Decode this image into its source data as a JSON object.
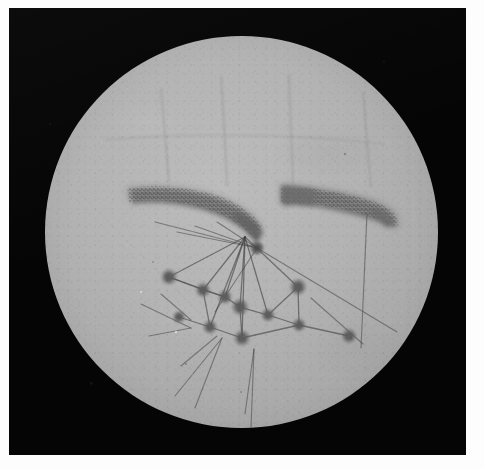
{
  "figure": {
    "name": "circular-field-photomicrograph",
    "caption": "",
    "label": ""
  },
  "plate": {
    "width": 484,
    "height": 469,
    "margin_color": "#fdfdfd",
    "field_color": "#050505",
    "field": {
      "x": 9,
      "y": 8,
      "width": 457,
      "height": 447
    }
  },
  "field_of_view": {
    "shape": "circle",
    "center_x": 241,
    "center_y": 232,
    "radius": 196,
    "fill_color": "#b3b3b3",
    "rim_color": "#8f9090"
  },
  "bands": [
    {
      "id": "band-left",
      "label": "left dark band",
      "color": "#7a7a7a",
      "start_x": 126,
      "start_y": 192,
      "end_x": 253,
      "end_y": 237,
      "thickness": 20,
      "note": "tapers from blunt left tip, curves downward to the hub"
    },
    {
      "id": "band-right",
      "label": "right dark band",
      "color": "#7c7c7c",
      "start_x": 272,
      "start_y": 188,
      "end_x": 385,
      "end_y": 219,
      "thickness": 19,
      "note": "roughly horizontal, slight downward slope to the right"
    }
  ],
  "faint_lines": {
    "label": "faint vertical striations in upper field",
    "color": "rgba(90,90,90,0.30)",
    "count": 4
  },
  "network": {
    "label": "node and filament network",
    "node_color": "#5d5d5d",
    "line_color": "rgba(70,70,70,0.62)",
    "hub": {
      "id": "hub",
      "x": 248,
      "y": 240,
      "radius": 4.5
    },
    "nodes": [
      {
        "id": "n1",
        "x": 172,
        "y": 280,
        "radius": 5.0
      },
      {
        "id": "n2",
        "x": 206,
        "y": 293,
        "radius": 4.6
      },
      {
        "id": "n3",
        "x": 228,
        "y": 300,
        "radius": 4.4
      },
      {
        "id": "n4",
        "x": 182,
        "y": 320,
        "radius": 3.8
      },
      {
        "id": "n5",
        "x": 243,
        "y": 310,
        "radius": 5.2
      },
      {
        "id": "n6",
        "x": 213,
        "y": 330,
        "radius": 4.4
      },
      {
        "id": "n7",
        "x": 245,
        "y": 341,
        "radius": 5.0
      },
      {
        "id": "n8",
        "x": 271,
        "y": 318,
        "radius": 4.2
      },
      {
        "id": "n9",
        "x": 301,
        "y": 290,
        "radius": 5.2
      },
      {
        "id": "n10",
        "x": 302,
        "y": 328,
        "radius": 4.2
      },
      {
        "id": "n11",
        "x": 352,
        "y": 339,
        "radius": 4.6
      }
    ],
    "edges": [
      [
        "hub",
        "n1"
      ],
      [
        "hub",
        "n2"
      ],
      [
        "hub",
        "n3"
      ],
      [
        "hub",
        "n5"
      ],
      [
        "hub",
        "n6"
      ],
      [
        "hub",
        "n7"
      ],
      [
        "hub",
        "n8"
      ],
      [
        "hub",
        "n9"
      ],
      [
        "n1",
        "n2"
      ],
      [
        "n2",
        "n3"
      ],
      [
        "n3",
        "n5"
      ],
      [
        "n5",
        "n8"
      ],
      [
        "n8",
        "n9"
      ],
      [
        "n8",
        "n10"
      ],
      [
        "n9",
        "n10"
      ],
      [
        "n10",
        "n11"
      ],
      [
        "n6",
        "n7"
      ],
      [
        "n7",
        "n10"
      ],
      [
        "n5",
        "n7"
      ],
      [
        "n2",
        "n6"
      ],
      [
        "n4",
        "n6"
      ],
      [
        "n1",
        "n3"
      ]
    ],
    "free_filaments": 9
  },
  "chart_data": {
    "type": "scatter",
    "title": "",
    "xlabel": "",
    "ylabel": "",
    "grid": false,
    "legend": "none",
    "xlim": [
      45,
      438
    ],
    "ylim": [
      36,
      428
    ],
    "series": [
      {
        "name": "network nodes",
        "marker": "filled circle",
        "color": "#5d5d5d",
        "x": [
          248,
          172,
          206,
          228,
          182,
          243,
          213,
          245,
          271,
          301,
          302,
          352
        ],
        "y": [
          240,
          280,
          293,
          300,
          320,
          310,
          330,
          341,
          318,
          290,
          328,
          339
        ],
        "sizes": [
          4.5,
          5.0,
          4.6,
          4.4,
          3.8,
          5.2,
          4.4,
          5.0,
          4.2,
          5.2,
          4.2,
          4.6
        ]
      }
    ]
  }
}
